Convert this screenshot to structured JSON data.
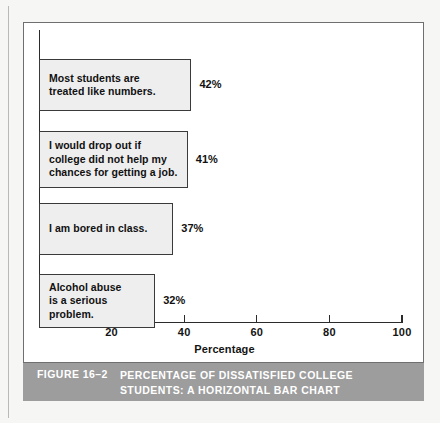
{
  "chart_data": {
    "type": "bar",
    "orientation": "horizontal",
    "title": "PERCENTAGE OF DISSATISFIED COLLEGE STUDENTS: A HORIZONTAL BAR CHART",
    "xlabel": "Percentage",
    "ylabel": "",
    "xlim": [
      0,
      100
    ],
    "grid": false,
    "legend": null,
    "categories": [
      "Most students are\ntreated like numbers.",
      "I would drop out if\ncollege did not help my\nchances for getting a job.",
      "I am bored in class.",
      "Alcohol abuse\nis a serious\nproblem."
    ],
    "values": [
      42,
      41,
      37,
      32
    ],
    "value_labels": [
      "42%",
      "41%",
      "37%",
      "32%"
    ],
    "xticks": [
      20,
      40,
      60,
      80,
      100
    ],
    "xtick_labels": [
      "20",
      "40",
      "60",
      "80",
      "100"
    ],
    "bar_fill_color": "#eeeeee",
    "bar_border_color": "#3a3a3a",
    "axis_color": "#2b2b2b"
  },
  "caption": {
    "figure_number": "FIGURE 16–2",
    "text": "PERCENTAGE OF DISSATISFIED COLLEGE\nSTUDENTS: A HORIZONTAL BAR CHART",
    "band_color": "#9d9d9d",
    "text_color": "#ffffff"
  }
}
